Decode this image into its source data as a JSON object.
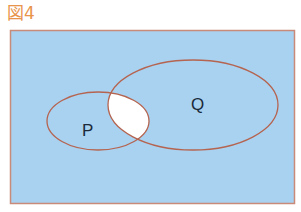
{
  "figure": {
    "label": "図4",
    "universe_fill": "#a9d1f0",
    "intersection_fill": "#ffffff",
    "outline_color": "#c0604a",
    "label_color": "#e8944a"
  },
  "sets": [
    {
      "name": "P"
    },
    {
      "name": "Q"
    }
  ],
  "highlighted_region": "P ∩ Q (unshaded)"
}
